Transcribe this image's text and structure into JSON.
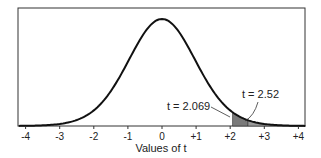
{
  "chart_data": {
    "type": "area",
    "title": "",
    "xlabel": "Values of t",
    "ylabel": "",
    "xlim": [
      -4.2,
      4.2
    ],
    "grid": false,
    "legend": null,
    "distribution": "Student t (df = 23), density curve",
    "x_ticks": [
      -4,
      -3,
      -2,
      -1,
      0,
      1,
      2,
      3,
      4
    ],
    "x_tick_labels": [
      "-4",
      "-3",
      "-2",
      "-1",
      "0",
      "+1",
      "+2",
      "+3",
      "+4"
    ],
    "shaded_regions": [
      {
        "from": 2.069,
        "to": 2.52,
        "color": "#7a7a7a"
      },
      {
        "from": 2.52,
        "to": 4.2,
        "color": "#9a9a9a"
      }
    ],
    "annotations": [
      {
        "text": "t = 2.069",
        "x": 2.069
      },
      {
        "text": "t = 2.52",
        "x": 2.52
      }
    ]
  },
  "axis": {
    "title": "Values of t",
    "ticks": [
      "-4",
      "-3",
      "-2",
      "-1",
      "0",
      "+1",
      "+2",
      "+3",
      "+4"
    ]
  },
  "annotations": {
    "left": "t = 2.069",
    "right": "t = 2.52"
  },
  "colors": {
    "curve": "#111111",
    "shade_dark": "#7a7a7a",
    "shade_light": "#9a9a9a",
    "frame": "#333333"
  }
}
